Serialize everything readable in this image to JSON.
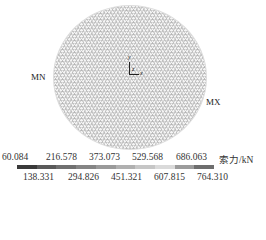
{
  "figure": {
    "min_label": "MN",
    "max_label": "MX",
    "axes": {
      "y": "y",
      "z": "z",
      "x": "x"
    }
  },
  "legend": {
    "unit_label": "索力/kN",
    "top_ticks": [
      "60.084",
      "216.578",
      "373.073",
      "529.568",
      "686.063"
    ],
    "bottom_ticks": [
      "138.331",
      "294.826",
      "451.321",
      "607.815",
      "764.310"
    ],
    "colors": [
      "#3a3a3a",
      "#5a5a5a",
      "#707070",
      "#858585",
      "#9a9a9a",
      "#b0b0b0",
      "#c6c6c6",
      "#dadada",
      "#9c9c9c",
      "#6e6e6e"
    ]
  }
}
